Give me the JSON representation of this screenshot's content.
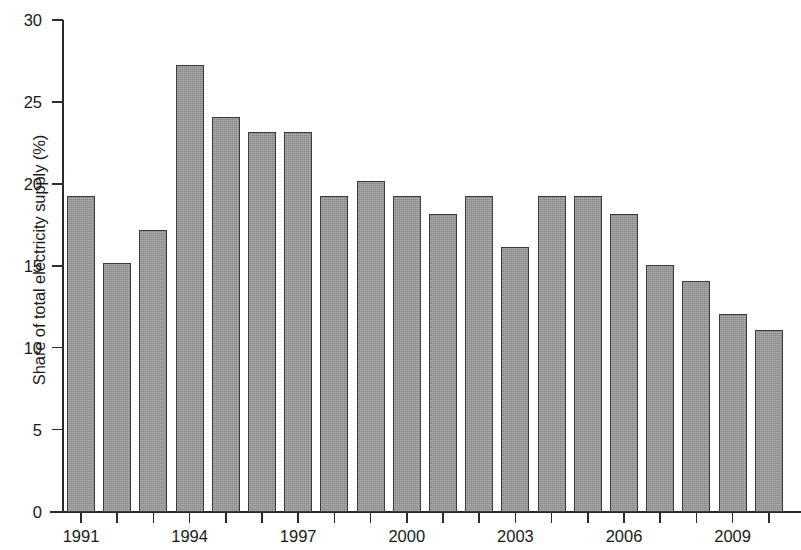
{
  "chart_data": {
    "type": "bar",
    "title": "",
    "subtitle": "",
    "xlabel": "",
    "ylabel": "Share of total electricity supply (%)",
    "categories": [
      "1991",
      "1992",
      "1993",
      "1994",
      "1995",
      "1996",
      "1997",
      "1998",
      "1999",
      "2000",
      "2001",
      "2002",
      "2003",
      "2004",
      "2005",
      "2006",
      "2007",
      "2008",
      "2009",
      "2010"
    ],
    "values": [
      19.3,
      15.2,
      17.2,
      27.3,
      24.1,
      23.2,
      23.2,
      19.3,
      20.2,
      19.3,
      18.2,
      19.3,
      16.2,
      19.3,
      19.3,
      18.2,
      15.1,
      14.1,
      12.1,
      11.1
    ],
    "ylim": [
      0,
      30
    ],
    "xlim_labels": [
      "1991",
      "2010"
    ],
    "y_ticks": [
      0,
      5,
      10,
      15,
      20,
      25,
      30
    ],
    "y_tick_labels": [
      "0",
      "5",
      "10",
      "15",
      "20",
      "25",
      "30"
    ],
    "x_tick_labels": [
      "1991",
      "1994",
      "1997",
      "2000",
      "2003",
      "2006",
      "2009"
    ],
    "x_tick_label_indices": [
      0,
      3,
      6,
      9,
      12,
      15,
      18
    ],
    "grid": false,
    "legend": null,
    "bar_color": "#9a9a9a",
    "bar_edge_color": "#3a3a3a",
    "axis_color": "#2b2b2b",
    "text_color": "#1a1a1a"
  }
}
